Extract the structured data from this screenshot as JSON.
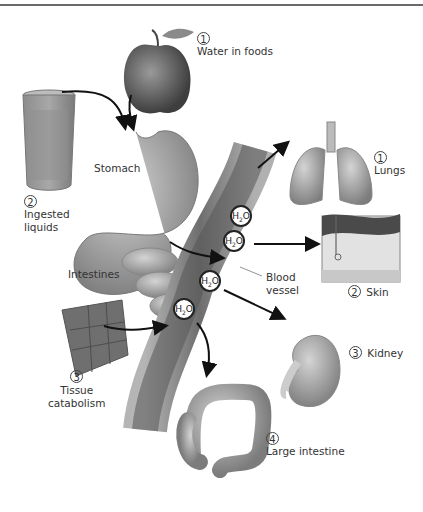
{
  "diagram": {
    "type": "water-intake-output-flow",
    "molecule_label": "H2O",
    "sources": [
      {
        "number": "1",
        "label": "Water in foods"
      },
      {
        "number": "2",
        "label": "Ingested liquids",
        "line1": "Ingested",
        "line2": "liquids"
      },
      {
        "number": "3",
        "label": "Tissue catabolism",
        "line1": "Tissue",
        "line2": "catabolism"
      }
    ],
    "organs": {
      "stomach": "Stomach",
      "intestines": "Intestines",
      "blood_vessel": "Blood vessel",
      "blood_vessel_line1": "Blood",
      "blood_vessel_line2": "vessel"
    },
    "outputs": [
      {
        "number": "1",
        "label": "Lungs"
      },
      {
        "number": "2",
        "label": "Skin"
      },
      {
        "number": "3",
        "label": "Kidney"
      },
      {
        "number": "4",
        "label": "Large intestine"
      }
    ],
    "colors": {
      "organ_gray": "#9a9a9a",
      "vessel_dark": "#6b6b6b",
      "arrow": "#111111",
      "rule_line": "#6a6a6a"
    }
  }
}
